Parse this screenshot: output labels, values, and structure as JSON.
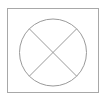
{
  "canvas": {
    "width": 107,
    "height": 101,
    "background_color": "#ffffff"
  },
  "figure": {
    "name": "circle-with-x-diagram",
    "stroke_color": "#9a9a9a",
    "frame_stroke_color": "#a8a8a8",
    "fill_color": "#ffffff",
    "stroke_width": 1
  },
  "shapes": {
    "frame": {
      "type": "rect",
      "x": 7.5,
      "y": 8.5,
      "width": 91,
      "height": 84
    },
    "circle": {
      "type": "circle",
      "cx": 53,
      "cy": 52.5,
      "r": 33.5
    },
    "diagonals": [
      {
        "name": "diagonal-nw-se",
        "x1": 29.3,
        "y1": 28.8,
        "x2": 76.7,
        "y2": 76.2
      },
      {
        "name": "diagonal-ne-sw",
        "x1": 76.7,
        "y1": 28.8,
        "x2": 29.3,
        "y2": 76.2
      }
    ],
    "center_point": {
      "cx": 53,
      "cy": 52.5
    }
  }
}
